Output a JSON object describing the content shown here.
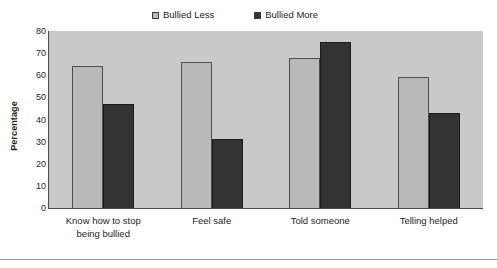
{
  "chart_data": {
    "type": "bar",
    "title": "",
    "xlabel": "",
    "ylabel": "Percentage",
    "ylim": [
      0,
      80
    ],
    "yticks": [
      80,
      70,
      60,
      50,
      40,
      30,
      20,
      10,
      0
    ],
    "grid": false,
    "legend_position": "top",
    "categories": [
      "Know  how  to stop being bullied",
      "Feel safe",
      "Told someone",
      "Telling helped"
    ],
    "category_lines": [
      [
        "Know  how  to stop",
        "being bullied"
      ],
      [
        "Feel safe"
      ],
      [
        "Told someone"
      ],
      [
        "Telling helped"
      ]
    ],
    "series": [
      {
        "name": "Bullied Less",
        "color": "#b9b9b9",
        "values": [
          64,
          66,
          68,
          59
        ]
      },
      {
        "name": "Bullied More",
        "color": "#333333",
        "values": [
          47,
          31,
          75,
          43
        ]
      }
    ]
  },
  "legend": {
    "entries": [
      {
        "label": "Bullied Less",
        "swatch": "legend-swatch-light-gray"
      },
      {
        "label": "Bullied More",
        "swatch": "legend-swatch-dark"
      }
    ]
  },
  "axes": {
    "y_title": "Percentage",
    "y_tick_labels": [
      "80",
      "70",
      "60",
      "50",
      "40",
      "30",
      "20",
      "10",
      "0"
    ]
  },
  "colors": {
    "plot_background": "#c9c9c9",
    "page_background": "#ffffff",
    "series_less": "#b9b9b9",
    "series_more": "#333333",
    "axis": "#4a4a4a",
    "text": "#231f20"
  }
}
